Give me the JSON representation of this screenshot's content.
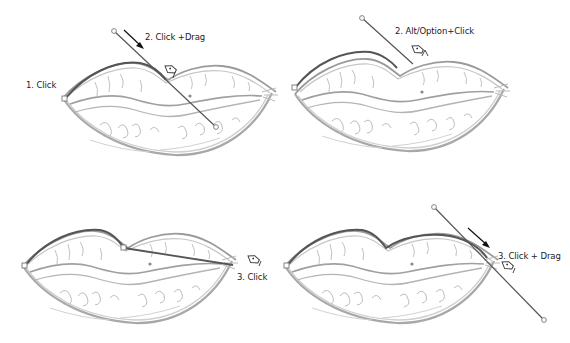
{
  "panels": [
    {
      "id": "panel-1",
      "labels": [
        {
          "text": "1. Click",
          "x": 26,
          "y": 80
        },
        {
          "text": "2. Click +Drag",
          "x": 145,
          "y": 32
        }
      ],
      "origin": [
        0,
        0
      ]
    },
    {
      "id": "panel-2",
      "labels": [
        {
          "text": "2. Alt/Option+Click",
          "x": 395,
          "y": 26
        }
      ],
      "origin": [
        285,
        0
      ]
    },
    {
      "id": "panel-3",
      "labels": [
        {
          "text": "3. Click",
          "x": 237,
          "y": 272
        }
      ],
      "origin": [
        0,
        170
      ]
    },
    {
      "id": "panel-4",
      "labels": [
        {
          "text": "3. Click + Drag",
          "x": 498,
          "y": 251
        }
      ],
      "origin": [
        285,
        170
      ]
    }
  ],
  "colors": {
    "path": "#555555",
    "sketch": "#9a9a9a",
    "sketch_light": "#c4c4c4",
    "anchor_fill": "#ffffff",
    "anchor_stroke": "#777777",
    "text": "#222222"
  }
}
